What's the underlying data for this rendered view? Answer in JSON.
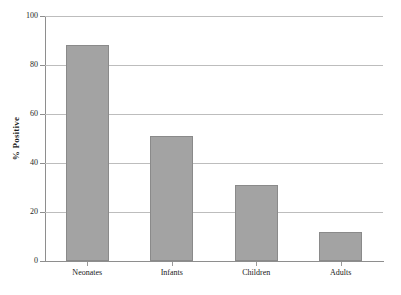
{
  "chart_data": {
    "type": "bar",
    "title": "",
    "subtitle": "",
    "xlabel": "",
    "ylabel": "% Positive",
    "categories": [
      "Neonates",
      "Infants",
      "Children",
      "Adults"
    ],
    "values": [
      88,
      51,
      31,
      12
    ],
    "series": [
      {
        "name": "% Positive",
        "values": [
          88,
          51,
          31,
          12
        ]
      }
    ],
    "ylim": [
      0,
      100
    ],
    "yticks": [
      0,
      20,
      40,
      60,
      80,
      100
    ],
    "ytick_labels": [
      "0",
      "20",
      "40",
      "60",
      "80",
      "100"
    ],
    "grid": {
      "horizontal": true,
      "vertical": false
    },
    "legend": {
      "visible": false,
      "position": "none",
      "entries": []
    },
    "annotations": [],
    "colors": {
      "bar_fill": "#a3a3a3",
      "bar_edge": "#8a8a8a",
      "gridline": "#bdbdbd",
      "axis": "#8e8e8e",
      "text": "#202020",
      "background": "#ffffff"
    }
  }
}
